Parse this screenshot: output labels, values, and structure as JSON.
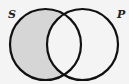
{
  "diagram": {
    "type": "venn",
    "sets": [
      {
        "label": "S",
        "cx": 45.5,
        "cy": 44.5,
        "r": 35.5
      },
      {
        "label": "P",
        "cx": 82.5,
        "cy": 44.5,
        "r": 35.5
      }
    ],
    "shaded_region": "S minus P",
    "colors": {
      "background": "#f4f4f4",
      "stroke": "#111111",
      "shade": "#d6d6d6"
    }
  }
}
